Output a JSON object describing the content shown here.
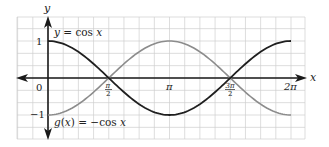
{
  "chart_data": {
    "type": "line",
    "title": "",
    "xlabel": "x",
    "ylabel": "y",
    "xlim": [
      -1.0,
      7.1
    ],
    "ylim": [
      -1.66,
      1.66
    ],
    "grid": true,
    "x_ticks": [
      {
        "value": 0,
        "label": "0"
      },
      {
        "value": 1.5708,
        "label_num": "π",
        "label_den": "2"
      },
      {
        "value": 3.1416,
        "label": "π"
      },
      {
        "value": 4.7124,
        "label_num": "3π",
        "label_den": "2"
      },
      {
        "value": 6.2832,
        "label": "2π"
      }
    ],
    "y_ticks": [
      {
        "value": 1,
        "label": "1"
      },
      {
        "value": -1,
        "label": "−1"
      }
    ],
    "series": [
      {
        "name": "y = cos x",
        "function": "cos",
        "color": "#1f1f1f",
        "x": [
          0,
          0.7854,
          1.5708,
          2.3562,
          3.1416,
          3.927,
          4.7124,
          5.4978,
          6.2832
        ],
        "y": [
          1,
          0.707,
          0,
          -0.707,
          -1,
          -0.707,
          0,
          0.707,
          1
        ]
      },
      {
        "name": "g(x) = −cos x",
        "function": "negcos",
        "color": "#8c8c8c",
        "x": [
          0,
          0.7854,
          1.5708,
          2.3562,
          3.1416,
          3.927,
          4.7124,
          5.4978,
          6.2832
        ],
        "y": [
          -1,
          -0.707,
          0,
          0.707,
          1,
          0.707,
          0,
          -0.707,
          -1
        ]
      }
    ],
    "annotations": [
      {
        "text": "y = cos x",
        "near": "top-left"
      },
      {
        "text": "g(x) = −cos x",
        "near": "bottom-left"
      }
    ]
  },
  "labels": {
    "y_axis": "y",
    "x_axis": "x",
    "origin": "0",
    "y_one": "1",
    "y_neg_one": "−1",
    "pi_half_num": "π",
    "pi_half_den": "2",
    "pi": "π",
    "three_pi_half_num": "3π",
    "three_pi_half_den": "2",
    "two_pi": "2π",
    "cos_label": "y = cos x",
    "negcos_label": "g(x) = −cos x"
  },
  "colors": {
    "grid": "#cfcfcf",
    "axis": "#1a1a1a",
    "cos": "#1f1f1f",
    "negcos": "#8c8c8c"
  }
}
